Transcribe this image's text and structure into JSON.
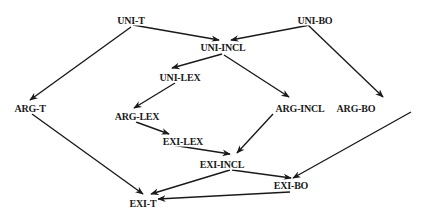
{
  "diagram": {
    "type": "directed-lattice",
    "colors": {
      "line": "#1a1a1a",
      "text": "#1a1a1a",
      "background": "#ffffff"
    },
    "nodes": [
      {
        "id": "uni-t",
        "label": "UNI-T",
        "x": 131,
        "y": 20
      },
      {
        "id": "uni-bo",
        "label": "UNI-BO",
        "x": 315,
        "y": 20
      },
      {
        "id": "uni-incl",
        "label": "UNI-INCL",
        "x": 223,
        "y": 47
      },
      {
        "id": "uni-lex",
        "label": "UNI-LEX",
        "x": 180,
        "y": 77
      },
      {
        "id": "arg-t",
        "label": "ARG-T",
        "x": 30,
        "y": 108
      },
      {
        "id": "arg-incl",
        "label": "ARG-INCL",
        "x": 300,
        "y": 108
      },
      {
        "id": "arg-bo",
        "label": "ARG-BO",
        "x": 356,
        "y": 108
      },
      {
        "id": "arg-lex",
        "label": "ARG-LEX",
        "x": 137,
        "y": 116
      },
      {
        "id": "exi-lex",
        "label": "EXI-LEX",
        "x": 183,
        "y": 141
      },
      {
        "id": "exi-incl",
        "label": "EXI-INCL",
        "x": 222,
        "y": 164
      },
      {
        "id": "exi-bo",
        "label": "EXI-BO",
        "x": 291,
        "y": 185
      },
      {
        "id": "exi-t",
        "label": "EXI-T",
        "x": 143,
        "y": 203
      }
    ],
    "edges": [
      {
        "from": "uni-t",
        "to": "uni-incl",
        "x1": 133,
        "y1": 25,
        "x2": 219,
        "y2": 40
      },
      {
        "from": "uni-t",
        "to": "arg-t",
        "x1": 131,
        "y1": 27,
        "x2": 30,
        "y2": 100
      },
      {
        "from": "uni-bo",
        "to": "uni-incl",
        "x1": 310,
        "y1": 25,
        "x2": 231,
        "y2": 40
      },
      {
        "from": "uni-bo",
        "to": "arg-bo",
        "x1": 308,
        "y1": 25,
        "x2": 383,
        "y2": 97
      },
      {
        "from": "uni-incl",
        "to": "uni-lex",
        "x1": 222,
        "y1": 54,
        "x2": 172,
        "y2": 68
      },
      {
        "from": "uni-incl",
        "to": "arg-incl",
        "x1": 224,
        "y1": 55,
        "x2": 289,
        "y2": 97
      },
      {
        "from": "uni-lex",
        "to": "arg-lex",
        "x1": 175,
        "y1": 83,
        "x2": 134,
        "y2": 108
      },
      {
        "from": "arg-lex",
        "to": "exi-lex",
        "x1": 136,
        "y1": 122,
        "x2": 169,
        "y2": 134
      },
      {
        "from": "exi-lex",
        "to": "exi-incl",
        "x1": 172,
        "y1": 145,
        "x2": 230,
        "y2": 154
      },
      {
        "from": "arg-incl",
        "to": "exi-incl",
        "x1": 273,
        "y1": 114,
        "x2": 237,
        "y2": 153
      },
      {
        "from": "arg-t",
        "to": "exi-t",
        "x1": 32,
        "y1": 114,
        "x2": 143,
        "y2": 194
      },
      {
        "from": "exi-incl",
        "to": "exi-t",
        "x1": 230,
        "y1": 170,
        "x2": 151,
        "y2": 194
      },
      {
        "from": "exi-incl",
        "to": "exi-bo",
        "x1": 232,
        "y1": 170,
        "x2": 291,
        "y2": 178
      },
      {
        "from": "arg-bo",
        "to": "exi-bo",
        "x1": 411,
        "y1": 112,
        "x2": 293,
        "y2": 178
      },
      {
        "from": "exi-bo",
        "to": "exi-t",
        "x1": 290,
        "y1": 192,
        "x2": 158,
        "y2": 199
      }
    ]
  }
}
